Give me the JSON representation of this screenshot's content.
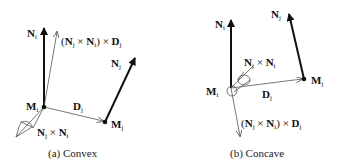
{
  "panels": [
    {
      "id": "a",
      "caption": "(a) Convex",
      "labels": {
        "Ni": "N",
        "Ni_sub": "i",
        "cross_prod": "(N",
        "Mi": "M",
        "Mj": "M",
        "Dj": "D",
        "Nj": "N",
        "NjxNi": "N"
      }
    },
    {
      "id": "b",
      "caption": "(b) Concave"
    }
  ],
  "text": {
    "N": "N",
    "M": "M",
    "D": "D",
    "i": "i",
    "j": "j",
    "times": "×",
    "lparen": "(",
    "rparen": ")"
  },
  "colors": {
    "stroke": "#111111",
    "thin": "#555555"
  }
}
